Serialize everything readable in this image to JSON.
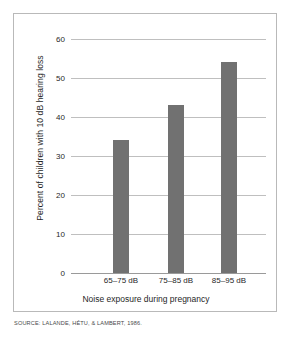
{
  "source_note": "SOURCE: LALANDE, HÉTU, & LAMBERT, 1986.",
  "colors": {
    "bar": "#717171",
    "gridline": "#bfbfbf",
    "axis": "#9a9a9a",
    "frame": "#b9b9b9",
    "text": "#1f1f1f",
    "background": "#ffffff"
  },
  "chart_data": {
    "type": "bar",
    "title": "",
    "xlabel": "Noise exposure during pregnancy",
    "ylabel": "Percent of children with 10 dB hearing loss",
    "categories": [
      "65–75 dB",
      "75–85 dB",
      "85–95 dB"
    ],
    "values": [
      34,
      43,
      54
    ],
    "ylim": [
      0,
      60
    ],
    "yticks": [
      0,
      10,
      20,
      30,
      40,
      50,
      60
    ],
    "ytick_labels": [
      "0",
      "10",
      "20",
      "30",
      "40",
      "50",
      "60"
    ],
    "grid": true,
    "legend": false,
    "legend_position": "none"
  }
}
